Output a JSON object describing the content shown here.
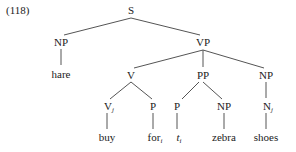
{
  "example_number": "(118)",
  "tree": {
    "S": {
      "label": "S"
    },
    "NP_subj": {
      "label": "NP",
      "leaf": "hare"
    },
    "VP": {
      "label": "VP"
    },
    "V": {
      "label": "V"
    },
    "Vj": {
      "label": "V",
      "sub": "j",
      "leaf": "buy"
    },
    "P1": {
      "label": "P",
      "leaf": "for",
      "leaf_sub": "i"
    },
    "PP": {
      "label": "PP"
    },
    "P2": {
      "label": "P",
      "leaf": "t",
      "leaf_sub": "i"
    },
    "NP_pp": {
      "label": "NP",
      "leaf": "zebra"
    },
    "NP_obj": {
      "label": "NP"
    },
    "Nj": {
      "label": "N",
      "sub": "j",
      "leaf": "shoes"
    }
  }
}
